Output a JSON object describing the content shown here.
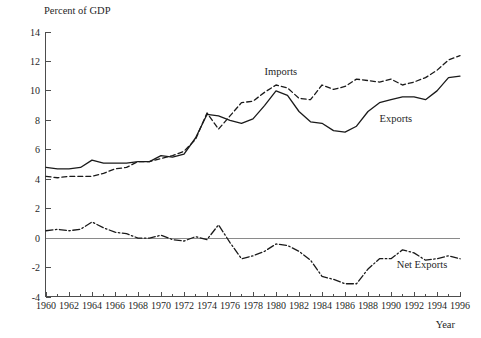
{
  "chart_data": {
    "type": "line",
    "title": "",
    "ylabel": "Percent of GDP",
    "xlabel": "Year",
    "xlim": [
      1960,
      1996
    ],
    "ylim": [
      -4,
      14
    ],
    "grid": false,
    "legend_position": "inline-annotations",
    "y_ticks": [
      14,
      12,
      10,
      8,
      6,
      4,
      2,
      0,
      -2,
      -4
    ],
    "y_tick_labels": [
      "14",
      "12",
      "10",
      "8",
      "6",
      "4",
      "2",
      "0",
      "-2",
      "-4"
    ],
    "x_ticks": [
      1960,
      1962,
      1964,
      1966,
      1968,
      1970,
      1972,
      1974,
      1976,
      1978,
      1980,
      1982,
      1984,
      1986,
      1988,
      1990,
      1992,
      1994,
      1996
    ],
    "x_tick_labels": [
      "1960",
      "1962",
      "1964",
      "1966",
      "1968",
      "1970",
      "1972",
      "1974",
      "1976",
      "1978",
      "1980",
      "1982",
      "1984",
      "1986",
      "1988",
      "1990",
      "1992",
      "1994",
      "1996"
    ],
    "x_minor_ticks": [
      1961,
      1963,
      1965,
      1967,
      1969,
      1971,
      1973,
      1975,
      1977,
      1979,
      1981,
      1983,
      1985,
      1987,
      1989,
      1991,
      1993,
      1995
    ],
    "zero_line": 0,
    "x": [
      1960,
      1961,
      1962,
      1963,
      1964,
      1965,
      1966,
      1967,
      1968,
      1969,
      1970,
      1971,
      1972,
      1973,
      1974,
      1975,
      1976,
      1977,
      1978,
      1979,
      1980,
      1981,
      1982,
      1983,
      1984,
      1985,
      1986,
      1987,
      1988,
      1989,
      1990,
      1991,
      1992,
      1993,
      1994,
      1995,
      1996
    ],
    "series": [
      {
        "name": "Exports",
        "style": "solid",
        "color": "#1a1a1a",
        "label_x": 1989.0,
        "label_y": 7.9,
        "values": [
          4.8,
          4.7,
          4.7,
          4.8,
          5.3,
          5.1,
          5.1,
          5.1,
          5.2,
          5.2,
          5.6,
          5.5,
          5.7,
          6.8,
          8.4,
          8.3,
          8.0,
          7.8,
          8.1,
          9.0,
          10.0,
          9.7,
          8.6,
          7.9,
          7.8,
          7.3,
          7.2,
          7.6,
          8.6,
          9.2,
          9.4,
          9.6,
          9.6,
          9.4,
          10.0,
          10.9,
          11.0
        ]
      },
      {
        "name": "Imports",
        "style": "dashed",
        "color": "#1a1a1a",
        "label_x": 1979.0,
        "label_y": 11.1,
        "values": [
          4.2,
          4.1,
          4.2,
          4.2,
          4.2,
          4.4,
          4.7,
          4.8,
          5.2,
          5.2,
          5.4,
          5.6,
          5.9,
          6.7,
          8.5,
          7.4,
          8.3,
          9.2,
          9.3,
          9.9,
          10.4,
          10.2,
          9.5,
          9.4,
          10.4,
          10.1,
          10.3,
          10.8,
          10.7,
          10.6,
          10.8,
          10.4,
          10.6,
          10.9,
          11.4,
          12.1,
          12.4
        ]
      },
      {
        "name": "Net Exports",
        "style": "dash-dot",
        "color": "#1a1a1a",
        "label_x": 1990.5,
        "label_y": -2.0,
        "values": [
          0.5,
          0.6,
          0.5,
          0.6,
          1.1,
          0.7,
          0.4,
          0.3,
          0.0,
          0.0,
          0.2,
          -0.1,
          -0.2,
          0.1,
          -0.1,
          0.9,
          -0.3,
          -1.4,
          -1.2,
          -0.9,
          -0.4,
          -0.5,
          -0.9,
          -1.5,
          -2.6,
          -2.8,
          -3.1,
          -3.1,
          -2.1,
          -1.4,
          -1.4,
          -0.8,
          -1.0,
          -1.5,
          -1.4,
          -1.2,
          -1.4
        ]
      }
    ]
  }
}
